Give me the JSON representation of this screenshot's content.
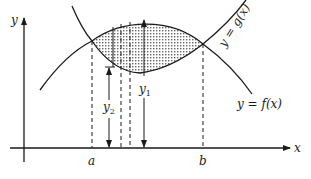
{
  "figure": {
    "colors": {
      "ink": "#1a1a1a",
      "background": "#ffffff",
      "shade": "#777777"
    },
    "axes": {
      "x_label": "x",
      "y_label": "y"
    },
    "curves": {
      "g": {
        "label": "y = g(x)"
      },
      "f": {
        "label": "y = f(x)"
      }
    },
    "points": {
      "a": "a",
      "b": "b"
    },
    "segments": {
      "y1": "y",
      "y1_sub": "1",
      "y2": "y",
      "y2_sub": "2"
    }
  }
}
